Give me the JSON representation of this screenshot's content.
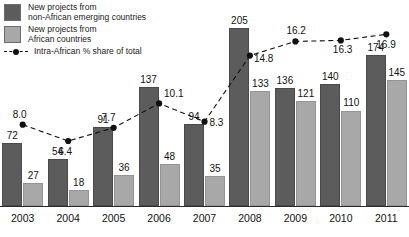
{
  "legend": {
    "series_dark_label": "New projects from\nnon-African emerging countries",
    "series_light_label": "New projects from\nAfrican countries",
    "line_label": "Intra-African % share of total"
  },
  "colors": {
    "dark_bar": "#5c5c5c",
    "light_bar": "#a8a8a8",
    "line": "#111111",
    "background": "#ffffff"
  },
  "chart_data": {
    "type": "bar",
    "title": "",
    "subtitle": "",
    "xlabel": "",
    "ylabel": "",
    "grid": false,
    "legend_position": "top-left",
    "categories": [
      "2003",
      "2004",
      "2005",
      "2006",
      "2007",
      "2008",
      "2009",
      "2010",
      "2011"
    ],
    "series": [
      {
        "name": "New projects from non-African emerging countries",
        "type": "bar",
        "color": "#5c5c5c",
        "values": [
          72,
          54,
          91,
          137,
          94,
          205,
          136,
          140,
          174
        ]
      },
      {
        "name": "New projects from African countries",
        "type": "bar",
        "color": "#a8a8a8",
        "values": [
          27,
          18,
          36,
          48,
          35,
          133,
          121,
          110,
          145
        ]
      },
      {
        "name": "Intra-African % share of total",
        "type": "line",
        "color": "#111111",
        "linestyle": "dashed",
        "marker": "circle",
        "values": [
          8.0,
          6.4,
          7.7,
          10.1,
          8.3,
          14.8,
          16.2,
          16.3,
          16.9
        ]
      }
    ],
    "bar_ylim": [
      0,
      205
    ],
    "line_ylim": [
      0,
      18.5
    ]
  },
  "bar_labels": {
    "dark": [
      "72",
      "54",
      "91",
      "137",
      "94",
      "205",
      "136",
      "140",
      "174"
    ],
    "light": [
      "27",
      "18",
      "36",
      "48",
      "35",
      "133",
      "121",
      "110",
      "145"
    ]
  },
  "line_labels": [
    "8.0",
    "6.4",
    "7.7",
    "10.1",
    "8.3",
    "14.8",
    "16.2",
    "16.3",
    "16.9"
  ],
  "xticks": [
    "2003",
    "2004",
    "2005",
    "2006",
    "2007",
    "2008",
    "2009",
    "2010",
    "2011"
  ]
}
